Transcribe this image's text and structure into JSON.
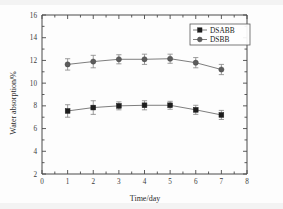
{
  "chart_data": {
    "type": "line",
    "title": "",
    "subtitle": "",
    "xlabel": "Time/day",
    "ylabel": "Water absorption/%",
    "xlim": [
      0,
      8
    ],
    "ylim": [
      2,
      16
    ],
    "xticks": [
      0,
      1,
      2,
      3,
      4,
      5,
      6,
      7,
      8
    ],
    "yticks": [
      2,
      4,
      6,
      8,
      10,
      12,
      14,
      16
    ],
    "xtick_labels": [
      "0",
      "1",
      "2",
      "3",
      "4",
      "5",
      "6",
      "7",
      "8"
    ],
    "ytick_labels": [
      "2",
      "4",
      "6",
      "8",
      "10",
      "12",
      "14",
      "16"
    ],
    "grid": false,
    "legend_position": "top-right",
    "x": [
      1,
      2,
      3,
      4,
      5,
      6,
      7
    ],
    "series": [
      {
        "name": "DSABB",
        "marker": "square",
        "color": "#1d1d1d",
        "values": [
          7.55,
          7.85,
          8.0,
          8.05,
          8.05,
          7.65,
          7.2
        ],
        "errors": [
          0.55,
          0.6,
          0.35,
          0.4,
          0.35,
          0.4,
          0.4
        ]
      },
      {
        "name": "DSBB",
        "marker": "circle",
        "color": "#5c5c5c",
        "values": [
          11.65,
          11.9,
          12.1,
          12.1,
          12.15,
          11.8,
          11.2
        ],
        "errors": [
          0.5,
          0.55,
          0.4,
          0.45,
          0.4,
          0.45,
          0.45
        ]
      }
    ],
    "annotations": []
  },
  "legend": {
    "entries": [
      {
        "label": "DSABB"
      },
      {
        "label": "DSBB"
      }
    ]
  },
  "axes": {
    "x_title": "Time/day",
    "y_title": "Water absorption/%"
  }
}
